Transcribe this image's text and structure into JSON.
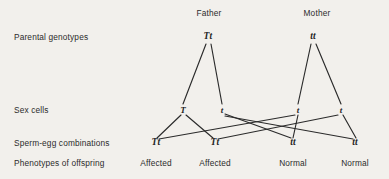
{
  "figure": {
    "background_color": "#f2f0ec",
    "ink_color": "#2b2b2b",
    "title": "",
    "type": "genetic-inheritance-cross-diagram"
  },
  "column_headers": [
    {
      "label": "Father",
      "x": 209,
      "y": 13
    },
    {
      "label": "Mother",
      "x": 317,
      "y": 13
    }
  ],
  "row_labels": [
    {
      "label": "Parental genotypes",
      "x": 14,
      "y": 37
    },
    {
      "label": "Sex cells",
      "x": 14,
      "y": 110
    },
    {
      "label": "Sperm-egg combinations",
      "x": 14,
      "y": 143
    },
    {
      "label": "Phenotypes of offspring",
      "x": 14,
      "y": 163
    }
  ],
  "parents": [
    {
      "genotype": "Tt",
      "parent": "Father",
      "x": 208,
      "y": 37
    },
    {
      "genotype": "tt",
      "parent": "Mother",
      "x": 313,
      "y": 37
    }
  ],
  "sex_cells": [
    {
      "allele": "T",
      "from": "Father",
      "x": 183,
      "y": 110
    },
    {
      "allele": "t",
      "from": "Father",
      "x": 222,
      "y": 110
    },
    {
      "allele": "t",
      "from": "Mother",
      "x": 298,
      "y": 110
    },
    {
      "allele": "t",
      "from": "Mother",
      "x": 341,
      "y": 110
    }
  ],
  "combinations": [
    {
      "genotype": "Tt",
      "x": 156,
      "y": 143
    },
    {
      "genotype": "Tt",
      "x": 215,
      "y": 143
    },
    {
      "genotype": "tt",
      "x": 293,
      "y": 143
    },
    {
      "genotype": "tt",
      "x": 355,
      "y": 143
    }
  ],
  "phenotypes": [
    {
      "label": "Affected",
      "x": 156,
      "y": 163
    },
    {
      "label": "Affected",
      "x": 215,
      "y": 163
    },
    {
      "label": "Normal",
      "x": 293,
      "y": 163
    },
    {
      "label": "Normal",
      "x": 355,
      "y": 163
    }
  ],
  "meiosis_lines": [
    {
      "name": "father-Tt-to-T",
      "x1": 206,
      "y1": 44,
      "x2": 183,
      "y2": 104
    },
    {
      "name": "father-Tt-to-t",
      "x1": 211,
      "y1": 44,
      "x2": 222,
      "y2": 104
    },
    {
      "name": "mother-tt-to-t-left",
      "x1": 311,
      "y1": 44,
      "x2": 298,
      "y2": 104
    },
    {
      "name": "mother-tt-to-t-right",
      "x1": 316,
      "y1": 44,
      "x2": 341,
      "y2": 104
    }
  ],
  "fertilization_lines": [
    {
      "name": "fatherT-to-combo1",
      "x1": 181,
      "y1": 115,
      "x2": 157,
      "y2": 138
    },
    {
      "name": "fatherT-to-combo2",
      "x1": 186,
      "y1": 115,
      "x2": 213,
      "y2": 138
    },
    {
      "name": "fathert-to-combo3",
      "x1": 225,
      "y1": 114,
      "x2": 291,
      "y2": 138
    },
    {
      "name": "fathert-to-combo4",
      "x1": 225,
      "y1": 116,
      "x2": 353,
      "y2": 139
    },
    {
      "name": "mothert-left-to-combo1",
      "x1": 295,
      "y1": 115,
      "x2": 159,
      "y2": 139
    },
    {
      "name": "mothert-left-to-combo3",
      "x1": 298,
      "y1": 115,
      "x2": 293,
      "y2": 138
    },
    {
      "name": "mothert-right-to-combo2",
      "x1": 338,
      "y1": 115,
      "x2": 218,
      "y2": 139
    },
    {
      "name": "mothert-right-to-combo4",
      "x1": 343,
      "y1": 115,
      "x2": 356,
      "y2": 138
    }
  ]
}
